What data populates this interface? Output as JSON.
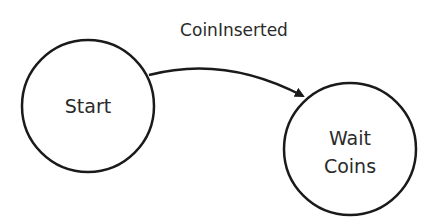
{
  "diagram": {
    "type": "state-machine",
    "colors": {
      "stroke": "#1a1a1a",
      "text": "#2a2a2a",
      "background": "#ffffff"
    },
    "states": [
      {
        "id": "start",
        "label": "Start",
        "lines": [
          "Start"
        ]
      },
      {
        "id": "wait-coins",
        "label": "Wait Coins",
        "lines": [
          "Wait",
          "Coins"
        ]
      }
    ],
    "transitions": [
      {
        "from": "start",
        "to": "wait-coins",
        "label": "CoinInserted"
      }
    ]
  }
}
